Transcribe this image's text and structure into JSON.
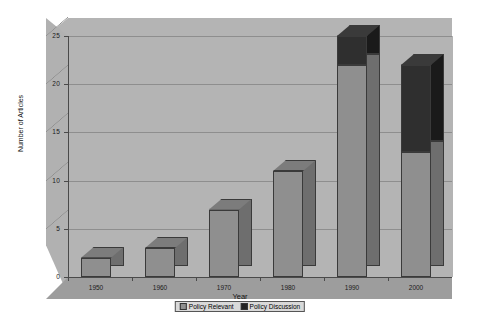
{
  "chart_data": {
    "type": "bar",
    "subtype": "stacked-3d-column",
    "title": "",
    "xlabel": "Year",
    "ylabel": "Number of Articles",
    "categories": [
      "1950",
      "1960",
      "1970",
      "1980",
      "1990",
      "2000"
    ],
    "series": [
      {
        "name": "Policy Relevant",
        "color": "#8f8f8f",
        "values": [
          2,
          3,
          7,
          11,
          22,
          13
        ]
      },
      {
        "name": "Policy Discussion",
        "color": "#2f2f2f",
        "values": [
          0,
          0,
          0,
          0,
          3,
          9
        ]
      }
    ],
    "totals": [
      2,
      3,
      7,
      11,
      25,
      22
    ],
    "ylim": [
      0,
      25
    ],
    "yticks": [
      "0",
      "5",
      "10",
      "15",
      "20",
      "25"
    ],
    "ytick_values": [
      0,
      5,
      10,
      15,
      20,
      25
    ],
    "grid": true,
    "legend_position": "bottom",
    "legend_entries": [
      "Policy Relevant",
      "Policy Discussion"
    ],
    "plot_background": "#b4b4b4",
    "page_background": "#ffffff"
  }
}
